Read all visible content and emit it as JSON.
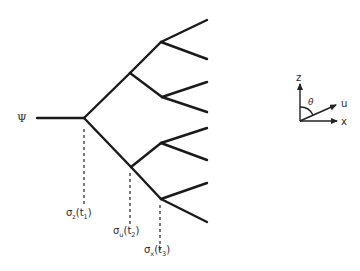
{
  "diagram": {
    "type": "measurement-branching-tree",
    "initial_state": {
      "label": "Ψ"
    },
    "measurements": [
      {
        "operator": "σ",
        "subscript": "z",
        "time": "t",
        "time_subscript": "1",
        "full": "σz(t1)"
      },
      {
        "operator": "σ",
        "subscript": "u",
        "time": "t",
        "time_subscript": "2",
        "full": "σu(t2)"
      },
      {
        "operator": "σ",
        "subscript": "x",
        "time": "t",
        "time_subscript": "3",
        "full": "σx(t3)"
      }
    ],
    "tree": {
      "levels": 3,
      "leaves": 8
    },
    "axes": {
      "z_label": "z",
      "u_label": "u",
      "x_label": "x",
      "angle_label": "θ"
    },
    "colors": {
      "line": "#1a1a1a",
      "background": "#ffffff"
    }
  }
}
